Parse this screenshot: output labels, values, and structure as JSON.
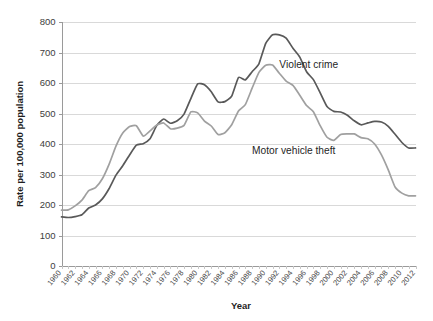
{
  "chart_data": {
    "type": "line",
    "title": "",
    "xlabel": "Year",
    "ylabel": "Rate per 100,000 population",
    "xlim": [
      1960,
      2012
    ],
    "ylim": [
      0,
      800
    ],
    "ytick_step": 100,
    "xtick_step": 2,
    "grid": "horizontal",
    "legend_position": "inline-annotation",
    "yticks": [
      "0",
      "100",
      "200",
      "300",
      "400",
      "500",
      "600",
      "700",
      "800"
    ],
    "xticks": [
      "1960",
      "1962",
      "1964",
      "1966",
      "1968",
      "1970",
      "1972",
      "1974",
      "1976",
      "1978",
      "1980",
      "1982",
      "1984",
      "1986",
      "1988",
      "1990",
      "1992",
      "1994",
      "1996",
      "1998",
      "2000",
      "2002",
      "2004",
      "2006",
      "2008",
      "2010",
      "2012"
    ],
    "x": [
      1960,
      1961,
      1962,
      1963,
      1964,
      1965,
      1966,
      1967,
      1968,
      1969,
      1970,
      1971,
      1972,
      1973,
      1974,
      1975,
      1976,
      1977,
      1978,
      1979,
      1980,
      1981,
      1982,
      1983,
      1984,
      1985,
      1986,
      1987,
      1988,
      1989,
      1990,
      1991,
      1992,
      1993,
      1994,
      1995,
      1996,
      1997,
      1998,
      1999,
      2000,
      2001,
      2002,
      2003,
      2004,
      2005,
      2006,
      2007,
      2008,
      2009,
      2010,
      2011,
      2012
    ],
    "series": [
      {
        "name": "Violent crime",
        "color": "#595959",
        "label": "Violent crime",
        "label_x": 1992,
        "label_y": 650,
        "values": [
          161,
          159,
          162,
          168,
          190,
          200,
          220,
          254,
          298,
          329,
          364,
          396,
          401,
          417,
          461,
          482,
          468,
          476,
          498,
          549,
          597,
          594,
          571,
          538,
          539,
          557,
          618,
          610,
          637,
          663,
          730,
          758,
          758,
          747,
          714,
          685,
          637,
          611,
          568,
          523,
          507,
          505,
          494,
          476,
          463,
          469,
          474,
          472,
          458,
          432,
          405,
          387,
          387
        ]
      },
      {
        "name": "Motor vehicle theft",
        "color": "#a0a0a0",
        "label": "Motor vehicle theft",
        "label_x": 1988,
        "label_y": 368,
        "values": [
          183,
          184,
          197,
          216,
          247,
          257,
          286,
          334,
          393,
          436,
          457,
          460,
          426,
          443,
          462,
          469,
          450,
          452,
          461,
          505,
          502,
          475,
          459,
          431,
          437,
          463,
          508,
          529,
          583,
          635,
          658,
          659,
          632,
          606,
          592,
          560,
          526,
          506,
          460,
          422,
          412,
          431,
          433,
          433,
          421,
          417,
          400,
          364,
          315,
          259,
          239,
          230,
          230
        ]
      }
    ]
  }
}
